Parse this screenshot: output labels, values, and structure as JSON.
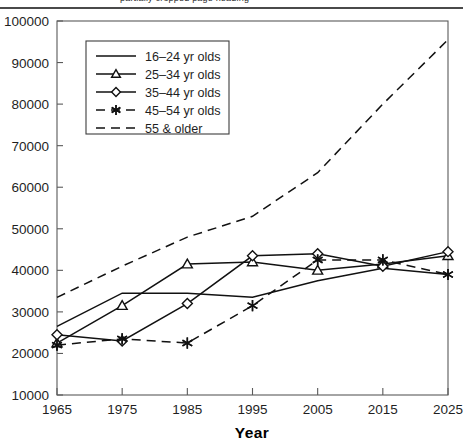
{
  "header": {
    "clipped_text": "partially cropped page heading",
    "rule": "horizontal-rule"
  },
  "chart_data": {
    "type": "line",
    "title": "",
    "subtitle": "",
    "xlabel": "Year",
    "ylabel": "",
    "x": [
      1965,
      1975,
      1985,
      1995,
      2005,
      2015,
      2025
    ],
    "categories": [
      "1965",
      "1975",
      "1985",
      "1995",
      "2005",
      "2015",
      "2025"
    ],
    "xlim": [
      1965,
      2025
    ],
    "ylim": [
      10000,
      100000
    ],
    "ytick_labels": [
      "10000",
      "20000",
      "30000",
      "40000",
      "50000",
      "60000",
      "70000",
      "80000",
      "90000",
      "100000"
    ],
    "yticks": [
      10000,
      20000,
      30000,
      40000,
      50000,
      60000,
      70000,
      80000,
      90000,
      100000
    ],
    "xtick_labels": [
      "1965",
      "1975",
      "1985",
      "1995",
      "2005",
      "2015",
      "2025"
    ],
    "grid": false,
    "legend_position": "upper-left-inside",
    "series": [
      {
        "name": "16–24 yr olds",
        "marker": "none",
        "dash": "solid",
        "values": [
          26500,
          34500,
          34500,
          33500,
          37500,
          40500,
          39000
        ]
      },
      {
        "name": "25–34 yr olds",
        "marker": "triangle",
        "dash": "solid",
        "values": [
          22500,
          31500,
          41500,
          42000,
          40000,
          41500,
          43500
        ]
      },
      {
        "name": "35–44 yr olds",
        "marker": "diamond",
        "dash": "solid",
        "values": [
          24500,
          23000,
          32000,
          43500,
          44000,
          41000,
          44500
        ]
      },
      {
        "name": "45–54 yr olds",
        "marker": "star",
        "dash": "dashed",
        "values": [
          22000,
          23500,
          22500,
          31500,
          42500,
          42500,
          39000
        ]
      },
      {
        "name": "55 & older",
        "marker": "none",
        "dash": "dashed",
        "values": [
          33500,
          41000,
          48000,
          53000,
          63500,
          80000,
          95500
        ]
      }
    ],
    "legend_entries": [
      "16–24 yr olds",
      "25–34 yr olds",
      "35–44 yr olds",
      "45–54 yr olds",
      "55 & older"
    ],
    "colors": {
      "line": "#111111",
      "axis": "#5a5a5a",
      "text": "#1f1f1f",
      "background": "#ffffff"
    }
  }
}
